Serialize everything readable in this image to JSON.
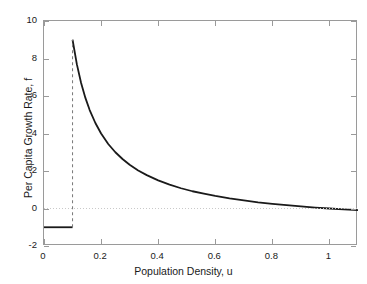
{
  "chart_data": {
    "type": "line",
    "title": "",
    "xlabel": "Population Density, u",
    "ylabel": "Per Capita Growth Rate, f",
    "xlim": [
      0,
      1.1
    ],
    "ylim": [
      -2,
      10
    ],
    "xticks": [
      0,
      0.2,
      0.4,
      0.6,
      0.8,
      1
    ],
    "xticklabels": [
      "0",
      "0.2",
      "0.4",
      "0.6",
      "0.8",
      "1"
    ],
    "yticks": [
      -2,
      0,
      2,
      4,
      6,
      8,
      10
    ],
    "yticklabels": [
      "-2",
      "0",
      "2",
      "4",
      "6",
      "8",
      "10"
    ],
    "grid": false,
    "legend": null,
    "series": [
      {
        "name": "per-capita-growth-rate-curve",
        "style": "solid",
        "color": "#1a1a1a",
        "width": 1.8,
        "description": "Hyperbolic decay f = 1/u - 1 from u=0.1 to u=1.1",
        "x": [
          0.1,
          0.115,
          0.13,
          0.145,
          0.16,
          0.18,
          0.2,
          0.225,
          0.25,
          0.275,
          0.3,
          0.33,
          0.36,
          0.4,
          0.44,
          0.48,
          0.52,
          0.56,
          0.6,
          0.65,
          0.7,
          0.75,
          0.8,
          0.85,
          0.9,
          0.95,
          1.0,
          1.05,
          1.1
        ],
        "y": [
          9.0,
          7.7,
          6.69,
          5.9,
          5.25,
          4.56,
          4.0,
          3.44,
          3.0,
          2.64,
          2.33,
          2.03,
          1.78,
          1.5,
          1.27,
          1.08,
          0.92,
          0.79,
          0.67,
          0.54,
          0.43,
          0.33,
          0.25,
          0.18,
          0.11,
          0.05,
          0.0,
          -0.05,
          -0.09
        ]
      },
      {
        "name": "allee-threshold-segment",
        "style": "solid",
        "color": "#1a1a1a",
        "width": 1.8,
        "description": "Horizontal segment at f = -1 for u in [0, 0.1]",
        "x": [
          0.0,
          0.1
        ],
        "y": [
          -1.0,
          -1.0
        ]
      },
      {
        "name": "discontinuity-dashed-line",
        "style": "dashed",
        "color": "#777777",
        "width": 1,
        "description": "Vertical dashed line at u = 0.1 from f = -1 to f = 9",
        "x": [
          0.1,
          0.1
        ],
        "y": [
          -1.0,
          9.0
        ]
      },
      {
        "name": "zero-reference-line",
        "style": "dotted",
        "color": "#c9c9c9",
        "width": 1,
        "description": "Horizontal dotted reference line at f = 0",
        "x": [
          0.0,
          1.1
        ],
        "y": [
          0.0,
          0.0
        ]
      }
    ]
  },
  "axes": {
    "box_color": "#9a9a9a"
  }
}
